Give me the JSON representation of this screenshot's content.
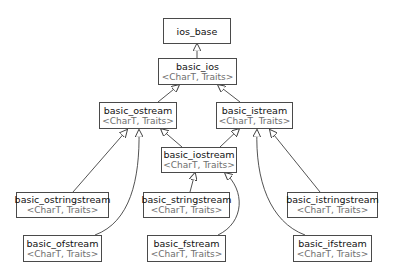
{
  "diagram": {
    "type": "inheritance-graph",
    "colors": {
      "edge": "#404040",
      "border": "#4a4a4a",
      "class_name": "#111111",
      "template": "#6e6e6e"
    },
    "nodes": [
      {
        "id": "ios_base",
        "name": "ios_base",
        "template": ""
      },
      {
        "id": "basic_ios",
        "name": "basic_ios",
        "template": "<CharT, Traits>"
      },
      {
        "id": "basic_ostream",
        "name": "basic_ostream",
        "template": "<CharT, Traits>"
      },
      {
        "id": "basic_istream",
        "name": "basic_istream",
        "template": "<CharT, Traits>"
      },
      {
        "id": "basic_iostream",
        "name": "basic_iostream",
        "template": "<CharT, Traits>"
      },
      {
        "id": "basic_ostringstream",
        "name": "basic_ostringstream",
        "template": "<CharT, Traits>"
      },
      {
        "id": "basic_stringstream",
        "name": "basic_stringstream",
        "template": "<CharT, Traits>"
      },
      {
        "id": "basic_istringstream",
        "name": "basic_istringstream",
        "template": "<CharT, Traits>"
      },
      {
        "id": "basic_ofstream",
        "name": "basic_ofstream",
        "template": "<CharT, Traits>"
      },
      {
        "id": "basic_fstream",
        "name": "basic_fstream",
        "template": "<CharT, Traits>"
      },
      {
        "id": "basic_ifstream",
        "name": "basic_ifstream",
        "template": "<CharT, Traits>"
      }
    ],
    "edges": [
      {
        "from": "basic_ios",
        "to": "ios_base"
      },
      {
        "from": "basic_ostream",
        "to": "basic_ios"
      },
      {
        "from": "basic_istream",
        "to": "basic_ios"
      },
      {
        "from": "basic_iostream",
        "to": "basic_ostream"
      },
      {
        "from": "basic_iostream",
        "to": "basic_istream"
      },
      {
        "from": "basic_ostringstream",
        "to": "basic_ostream"
      },
      {
        "from": "basic_ofstream",
        "to": "basic_ostream"
      },
      {
        "from": "basic_stringstream",
        "to": "basic_iostream"
      },
      {
        "from": "basic_fstream",
        "to": "basic_iostream"
      },
      {
        "from": "basic_istringstream",
        "to": "basic_istream"
      },
      {
        "from": "basic_ifstream",
        "to": "basic_istream"
      }
    ]
  }
}
